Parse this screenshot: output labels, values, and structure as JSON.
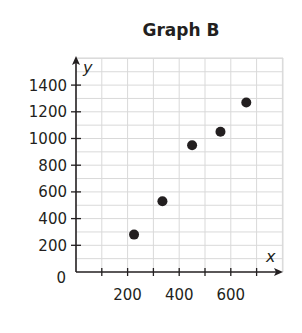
{
  "chart_data": {
    "type": "scatter",
    "title": "Graph B",
    "xlabel": "x",
    "ylabel": "y",
    "xlim": [
      0,
      800
    ],
    "ylim": [
      0,
      1500
    ],
    "x_tick_step": 100,
    "y_tick_step": 200,
    "x_tick_labels": [
      "200",
      "400",
      "600"
    ],
    "x_tick_label_values": [
      200,
      400,
      600
    ],
    "y_tick_labels": [
      "0",
      "200",
      "400",
      "600",
      "800",
      "1000",
      "1200",
      "1400"
    ],
    "y_tick_label_values": [
      0,
      200,
      400,
      600,
      800,
      1000,
      1200,
      1400
    ],
    "grid": true,
    "legend": null,
    "series": [
      {
        "name": "Graph B",
        "points": [
          {
            "x": 225,
            "y": 280
          },
          {
            "x": 335,
            "y": 530
          },
          {
            "x": 450,
            "y": 950
          },
          {
            "x": 560,
            "y": 1050
          },
          {
            "x": 660,
            "y": 1270
          }
        ]
      }
    ],
    "colors": {
      "ink": "#231f20",
      "grid": "#d9d9d9"
    }
  }
}
